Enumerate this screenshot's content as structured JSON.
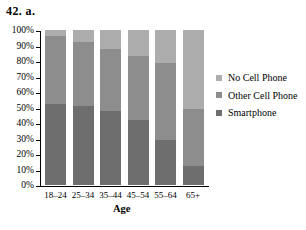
{
  "problem_label": "42. a.",
  "chart_data": {
    "type": "bar",
    "subtype": "stacked-100-percent",
    "title": "",
    "xlabel": "Age",
    "ylabel": "",
    "ylim": [
      0,
      100
    ],
    "ytick_labels": [
      "100%",
      "90%",
      "80%",
      "70%",
      "60%",
      "50%",
      "40%",
      "30%",
      "20%",
      "10%",
      "0%"
    ],
    "ytick_values": [
      100,
      90,
      80,
      70,
      60,
      50,
      40,
      30,
      20,
      10,
      0
    ],
    "categories": [
      "18–24",
      "25–34",
      "35–44",
      "45–54",
      "55–64",
      "65+"
    ],
    "grid": false,
    "legend_position": "right",
    "series": [
      {
        "name": "Smartphone",
        "color": "#6e6e6e",
        "values": [
          52,
          51,
          48,
          42,
          29,
          12
        ]
      },
      {
        "name": "Other Cell Phone",
        "color": "#8d8d8d",
        "values": [
          44,
          41,
          40,
          41,
          50,
          37
        ]
      },
      {
        "name": "No Cell Phone",
        "color": "#adadad",
        "values": [
          4,
          8,
          12,
          17,
          21,
          51
        ]
      }
    ]
  },
  "legend": {
    "items": [
      {
        "label": "No Cell Phone",
        "color": "#adadad"
      },
      {
        "label": "Other Cell Phone",
        "color": "#8d8d8d"
      },
      {
        "label": "Smartphone",
        "color": "#6e6e6e"
      }
    ]
  }
}
